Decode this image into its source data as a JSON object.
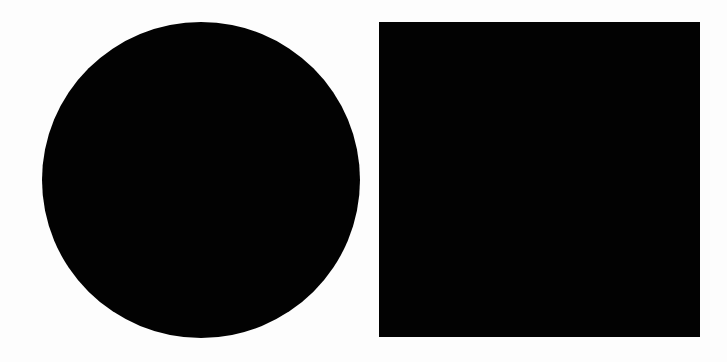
{
  "canvas": {
    "background": "#fdfdfd",
    "width": 727,
    "height": 362
  },
  "shapes": [
    {
      "type": "circle",
      "color": "#020202",
      "x": 42,
      "y": 22,
      "width": 318,
      "height": 316
    },
    {
      "type": "square",
      "color": "#020202",
      "x": 379,
      "y": 22,
      "width": 321,
      "height": 315
    }
  ]
}
